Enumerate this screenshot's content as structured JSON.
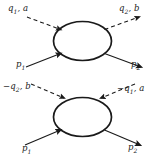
{
  "figure": {
    "type": "feynman-diagram-pair",
    "background_color": "#ffffff",
    "ink_color": "#1a1a1a",
    "width": 165,
    "height": 161
  },
  "diagrams": [
    {
      "id": "top",
      "blob_label": "",
      "legs": [
        {
          "name": "q1-a",
          "label": "q",
          "subscript": "1",
          "suffix": ", a",
          "line_style": "dashed",
          "direction": "incoming",
          "corner": "upper-left"
        },
        {
          "name": "q2-b",
          "label": "q",
          "subscript": "2",
          "suffix": ", b",
          "line_style": "dashed",
          "direction": "outgoing",
          "corner": "upper-right"
        },
        {
          "name": "p1",
          "label": "p",
          "subscript": "1",
          "suffix": "",
          "line_style": "solid",
          "direction": "incoming",
          "corner": "lower-left"
        },
        {
          "name": "p2",
          "label": "p",
          "subscript": "2",
          "suffix": "",
          "line_style": "solid",
          "direction": "outgoing",
          "corner": "lower-right"
        }
      ]
    },
    {
      "id": "bottom",
      "blob_label": "",
      "legs": [
        {
          "name": "minus-q2-b",
          "label": "−q",
          "subscript": "2",
          "suffix": ", b",
          "line_style": "dashed",
          "direction": "incoming",
          "corner": "upper-left"
        },
        {
          "name": "minus-q1-a",
          "label": "−q",
          "subscript": "1",
          "suffix": ", a",
          "line_style": "dashed",
          "direction": "incoming",
          "corner": "upper-right"
        },
        {
          "name": "p1",
          "label": "p",
          "subscript": "1",
          "suffix": "",
          "line_style": "solid",
          "direction": "incoming",
          "corner": "lower-left"
        },
        {
          "name": "p2",
          "label": "p",
          "subscript": "2",
          "suffix": "",
          "line_style": "solid",
          "direction": "outgoing",
          "corner": "lower-right"
        }
      ]
    }
  ],
  "labels": {
    "top_q1_a": "q",
    "top_q1_a_sub": "1",
    "top_q1_a_suffix": ", a",
    "top_q2_b": "q",
    "top_q2_b_sub": "2",
    "top_q2_b_suffix": ", b",
    "top_p1": "p",
    "top_p1_sub": "1",
    "top_p2": "p",
    "top_p2_sub": "2",
    "bottom_mq2_b": "−q",
    "bottom_mq2_b_sub": "2",
    "bottom_mq2_b_suffix": ", b",
    "bottom_mq1_a": "−q",
    "bottom_mq1_a_sub": "1",
    "bottom_mq1_a_suffix": ", a",
    "bottom_p1": "p",
    "bottom_p1_sub": "1",
    "bottom_p2": "p",
    "bottom_p2_sub": "2"
  }
}
